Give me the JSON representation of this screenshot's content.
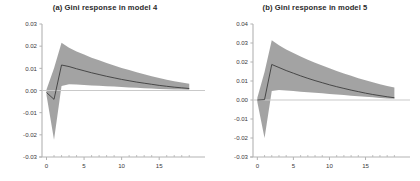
{
  "figure": {
    "background_color": "#ffffff",
    "band_color": "#9b9b9b",
    "line_color": "#3c3c3c",
    "axis_color": "#b3b3b3",
    "zero_line_color": "#c9c9c9",
    "text_color": "#2b2b2b"
  },
  "panels": [
    {
      "id": "panel-a",
      "title": "(a)  Gini response in model 4",
      "panel_label": "(a)",
      "chart_ref": 0
    },
    {
      "id": "panel-b",
      "title": "(b)  Gini response in model 5",
      "panel_label": "(b)",
      "chart_ref": 1
    }
  ],
  "chart_data": [
    {
      "type": "area",
      "title": "(a)  Gini response in model 4",
      "xlabel": "",
      "ylabel": "",
      "xlim": [
        -0.6,
        19.5
      ],
      "ylim": [
        -0.03,
        0.03
      ],
      "grid": false,
      "legend": "none",
      "xticks": [
        0,
        5,
        10,
        15
      ],
      "xtick_labels": [
        "0",
        "5",
        "10",
        "15"
      ],
      "xminor_step": 1,
      "yticks": [
        0.03,
        0.02,
        0.01,
        0.0,
        -0.01,
        -0.02,
        -0.03
      ],
      "ytick_labels": [
        "0.03",
        "0.02",
        "0.01",
        "0.00",
        "-0.01",
        "-0.02",
        "-0.03"
      ],
      "zero_line": 0.0,
      "x": [
        0,
        1,
        2,
        3,
        4,
        5,
        6,
        7,
        8,
        9,
        10,
        11,
        12,
        13,
        14,
        15,
        16,
        17,
        18,
        19
      ],
      "series": [
        {
          "name": "Gini impulse response (point estimate)",
          "role": "center",
          "values": [
            -0.0009,
            -0.004,
            0.0115,
            0.0108,
            0.0098,
            0.0089,
            0.008,
            0.0072,
            0.0064,
            0.0057,
            0.005,
            0.0044,
            0.0038,
            0.0033,
            0.0028,
            0.0023,
            0.0019,
            0.0015,
            0.0012,
            0.0009
          ]
        },
        {
          "name": "Upper confidence band",
          "role": "upper",
          "values": [
            0.0004,
            0.01,
            0.0215,
            0.0193,
            0.0176,
            0.0162,
            0.0148,
            0.0136,
            0.0124,
            0.0113,
            0.0102,
            0.0092,
            0.0082,
            0.0073,
            0.0064,
            0.0056,
            0.0049,
            0.0042,
            0.0036,
            0.0031
          ]
        },
        {
          "name": "Lower confidence band",
          "role": "lower",
          "values": [
            -0.0021,
            -0.0222,
            0.002,
            0.0028,
            0.0027,
            0.0025,
            0.0023,
            0.0021,
            0.0019,
            0.0018,
            0.0016,
            0.0014,
            0.0012,
            0.001,
            0.0009,
            0.0007,
            0.0006,
            0.0005,
            0.0004,
            0.0003
          ]
        }
      ]
    },
    {
      "type": "area",
      "title": "(b)  Gini response in model 5",
      "xlabel": "",
      "ylabel": "",
      "xlim": [
        -0.6,
        19.5
      ],
      "ylim": [
        -0.03,
        0.04
      ],
      "grid": false,
      "legend": "none",
      "xticks": [
        0,
        5,
        10,
        15
      ],
      "xtick_labels": [
        "0",
        "5",
        "10",
        "15"
      ],
      "xminor_step": 1,
      "yticks": [
        0.04,
        0.03,
        0.02,
        0.01,
        0.0,
        -0.01,
        -0.02,
        -0.03
      ],
      "ytick_labels": [
        "0.04",
        "0.03",
        "0.02",
        "0.01",
        "0.00",
        "-0.01",
        "-0.02",
        "-0.03"
      ],
      "zero_line": 0.0,
      "x": [
        0,
        1,
        2,
        3,
        4,
        5,
        6,
        7,
        8,
        9,
        10,
        11,
        12,
        13,
        14,
        15,
        16,
        17,
        18,
        19
      ],
      "series": [
        {
          "name": "Gini impulse response (point estimate)",
          "role": "center",
          "values": [
            0.0,
            0.0002,
            0.0187,
            0.0171,
            0.0155,
            0.0141,
            0.0127,
            0.0114,
            0.0102,
            0.0091,
            0.008,
            0.007,
            0.0061,
            0.0052,
            0.0044,
            0.0036,
            0.0029,
            0.0023,
            0.0017,
            0.0012
          ]
        },
        {
          "name": "Upper confidence band",
          "role": "upper",
          "values": [
            0.0012,
            0.0148,
            0.0315,
            0.0288,
            0.0266,
            0.0247,
            0.0229,
            0.0212,
            0.0196,
            0.0181,
            0.0167,
            0.0153,
            0.014,
            0.0127,
            0.0115,
            0.0104,
            0.0093,
            0.0083,
            0.0074,
            0.0066
          ]
        },
        {
          "name": "Lower confidence band",
          "role": "lower",
          "values": [
            -0.001,
            -0.02,
            0.0048,
            0.0052,
            0.005,
            0.0047,
            0.0044,
            0.0041,
            0.0038,
            0.0035,
            0.0032,
            0.0029,
            0.0026,
            0.0023,
            0.002,
            0.0017,
            0.0014,
            0.0011,
            0.0008,
            0.0006
          ]
        }
      ]
    }
  ]
}
